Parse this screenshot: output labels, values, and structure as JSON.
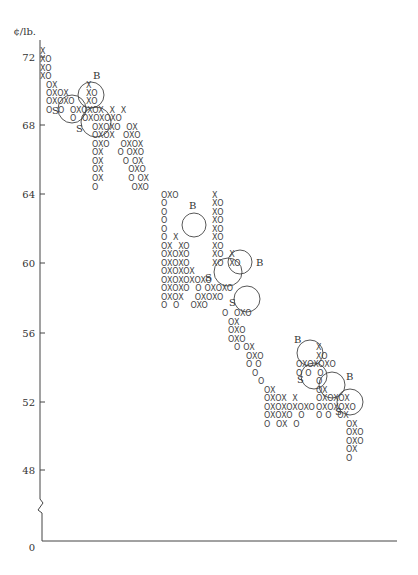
{
  "chart_data": {
    "type": "point-and-figure",
    "title": "",
    "ylabel": "¢/lb.",
    "xlabel": "",
    "y_ticks": [
      72,
      68,
      64,
      60,
      56,
      52,
      48
    ],
    "y_origin_label": "0",
    "axis_break": true,
    "box_size": 0.5,
    "ylim": [
      48,
      72.5
    ],
    "grid": false,
    "legend": null,
    "symbols": {
      "rising": "X",
      "falling": "O"
    },
    "trend": "downtrend from ~72 ¢/lb to ~50 ¢/lb",
    "signals": [
      {
        "label": "B",
        "type": "buy",
        "approx_price": 69.5
      },
      {
        "label": "S",
        "type": "sell",
        "approx_price": 68.8
      },
      {
        "label": "S",
        "type": "sell",
        "approx_price": 68.2
      },
      {
        "label": "B",
        "type": "buy",
        "approx_price": 62.0
      },
      {
        "label": "S",
        "type": "sell",
        "approx_price": 59.2
      },
      {
        "label": "B",
        "type": "buy",
        "approx_price": 60.0
      },
      {
        "label": "S",
        "type": "sell",
        "approx_price": 57.5
      },
      {
        "label": "B",
        "type": "buy",
        "approx_price": 54.5
      },
      {
        "label": "S",
        "type": "sell",
        "approx_price": 53.8
      },
      {
        "label": "B",
        "type": "buy",
        "approx_price": 53.0
      },
      {
        "label": "S",
        "type": "sell",
        "approx_price": 51.8
      }
    ],
    "rows": [
      {
        "x": 40,
        "y": 54,
        "text": "X"
      },
      {
        "x": 40,
        "y": 62,
        "text": "XO"
      },
      {
        "x": 40,
        "y": 71,
        "text": "XO"
      },
      {
        "x": 40,
        "y": 79,
        "text": "XO"
      },
      {
        "x": 46,
        "y": 88,
        "text": "OX"
      },
      {
        "x": 46,
        "y": 96,
        "text": "OXOX"
      },
      {
        "x": 46,
        "y": 104,
        "text": "OXOXO"
      },
      {
        "x": 46,
        "y": 113,
        "text": "O  O"
      },
      {
        "x": 86,
        "y": 88,
        "text": "X"
      },
      {
        "x": 86,
        "y": 96,
        "text": "XO"
      },
      {
        "x": 86,
        "y": 104,
        "text": "XO"
      },
      {
        "x": 70,
        "y": 113,
        "text": "OXOXOX  X  X"
      },
      {
        "x": 70,
        "y": 121,
        "text": "O  OXOXOXO"
      },
      {
        "x": 92,
        "y": 130,
        "text": "OXOXO  OX"
      },
      {
        "x": 92,
        "y": 138,
        "text": "OXOX   OXO"
      },
      {
        "x": 92,
        "y": 147,
        "text": "OXO    OXOX"
      },
      {
        "x": 92,
        "y": 155,
        "text": "OX     O OXO"
      },
      {
        "x": 92,
        "y": 164,
        "text": "OX       O OX"
      },
      {
        "x": 92,
        "y": 172,
        "text": "OX         OXO"
      },
      {
        "x": 92,
        "y": 181,
        "text": "OX         O OX"
      },
      {
        "x": 92,
        "y": 190,
        "text": "O            OXO"
      },
      {
        "x": 161,
        "y": 198,
        "text": "OXO"
      },
      {
        "x": 161,
        "y": 206,
        "text": "O"
      },
      {
        "x": 161,
        "y": 215,
        "text": "O"
      },
      {
        "x": 161,
        "y": 223,
        "text": "O"
      },
      {
        "x": 161,
        "y": 232,
        "text": "O"
      },
      {
        "x": 161,
        "y": 240,
        "text": "O  X"
      },
      {
        "x": 161,
        "y": 249,
        "text": "OX  XO"
      },
      {
        "x": 161,
        "y": 257,
        "text": "OXOXO"
      },
      {
        "x": 161,
        "y": 266,
        "text": "OXOXO"
      },
      {
        "x": 161,
        "y": 274,
        "text": "OXOXOX"
      },
      {
        "x": 161,
        "y": 283,
        "text": "OXOXOXOXO"
      },
      {
        "x": 212,
        "y": 198,
        "text": "X"
      },
      {
        "x": 212,
        "y": 206,
        "text": "XO"
      },
      {
        "x": 212,
        "y": 215,
        "text": "XO"
      },
      {
        "x": 212,
        "y": 223,
        "text": "XO"
      },
      {
        "x": 212,
        "y": 232,
        "text": "XO"
      },
      {
        "x": 212,
        "y": 240,
        "text": "XO"
      },
      {
        "x": 212,
        "y": 249,
        "text": "XO"
      },
      {
        "x": 212,
        "y": 257,
        "text": "XO  X"
      },
      {
        "x": 212,
        "y": 266,
        "text": "XO  XO"
      },
      {
        "x": 161,
        "y": 291,
        "text": "OXOXO  O OXOXO"
      },
      {
        "x": 161,
        "y": 300,
        "text": "OXOX    OXOXO"
      },
      {
        "x": 161,
        "y": 308,
        "text": "O  O    OXO"
      },
      {
        "x": 222,
        "y": 316,
        "text": "O  OXO"
      },
      {
        "x": 228,
        "y": 325,
        "text": "OX"
      },
      {
        "x": 228,
        "y": 333,
        "text": "OXO"
      },
      {
        "x": 228,
        "y": 342,
        "text": "OXO"
      },
      {
        "x": 234,
        "y": 350,
        "text": "O OX"
      },
      {
        "x": 246,
        "y": 359,
        "text": "OXO"
      },
      {
        "x": 246,
        "y": 367,
        "text": "O O"
      },
      {
        "x": 252,
        "y": 376,
        "text": "O"
      },
      {
        "x": 258,
        "y": 384,
        "text": "O"
      },
      {
        "x": 264,
        "y": 393,
        "text": "OX"
      },
      {
        "x": 264,
        "y": 401,
        "text": "OXOX  X"
      },
      {
        "x": 264,
        "y": 410,
        "text": "OXOXOXOXO"
      },
      {
        "x": 264,
        "y": 418,
        "text": "OXOXO  O"
      },
      {
        "x": 264,
        "y": 427,
        "text": "O  OX  O"
      }
    ],
    "rows_right": [
      {
        "x": 316,
        "y": 350,
        "text": "X"
      },
      {
        "x": 316,
        "y": 359,
        "text": "XO"
      },
      {
        "x": 296,
        "y": 367,
        "text": "OXOXOXO"
      },
      {
        "x": 296,
        "y": 376,
        "text": "O O  O"
      },
      {
        "x": 316,
        "y": 384,
        "text": "O"
      },
      {
        "x": 316,
        "y": 393,
        "text": "OX"
      },
      {
        "x": 316,
        "y": 401,
        "text": "OXOXOX"
      },
      {
        "x": 316,
        "y": 410,
        "text": "OXOXOXO"
      },
      {
        "x": 316,
        "y": 418,
        "text": "O O  OX"
      },
      {
        "x": 346,
        "y": 427,
        "text": "OX"
      },
      {
        "x": 346,
        "y": 435,
        "text": "OXO"
      },
      {
        "x": 346,
        "y": 444,
        "text": "OXO"
      },
      {
        "x": 346,
        "y": 452,
        "text": "OX"
      },
      {
        "x": 346,
        "y": 461,
        "text": "O"
      }
    ]
  },
  "axis": {
    "unit_label": "¢/lb.",
    "ticks": [
      {
        "label": "72",
        "y": 57
      },
      {
        "label": "68",
        "y": 125
      },
      {
        "label": "64",
        "y": 194
      },
      {
        "label": "60",
        "y": 263
      },
      {
        "label": "56",
        "y": 333
      },
      {
        "label": "52",
        "y": 402
      },
      {
        "label": "48",
        "y": 470
      }
    ],
    "origin_label": "0"
  },
  "circles": [
    {
      "cx": 91,
      "cy": 95,
      "r": 13,
      "label": "B",
      "lx": 93,
      "ly": 79,
      "side": "top"
    },
    {
      "cx": 72,
      "cy": 109,
      "r": 14,
      "label": "S",
      "lx": 52,
      "ly": 114,
      "side": "left"
    },
    {
      "cx": 96,
      "cy": 122,
      "r": 15,
      "label": "S",
      "lx": 76,
      "ly": 132,
      "side": "left"
    },
    {
      "cx": 194,
      "cy": 225,
      "r": 12,
      "label": "B",
      "lx": 189,
      "ly": 209,
      "side": "top"
    },
    {
      "cx": 228,
      "cy": 272,
      "r": 14,
      "label": "S",
      "lx": 205,
      "ly": 281,
      "side": "left"
    },
    {
      "cx": 240,
      "cy": 262,
      "r": 12,
      "label": "B",
      "lx": 256,
      "ly": 266,
      "side": "right"
    },
    {
      "cx": 247,
      "cy": 299,
      "r": 13,
      "label": "S",
      "lx": 229,
      "ly": 306,
      "side": "left"
    },
    {
      "cx": 310,
      "cy": 353,
      "r": 13,
      "label": "B",
      "lx": 294,
      "ly": 343,
      "side": "top"
    },
    {
      "cx": 314,
      "cy": 376,
      "r": 13,
      "label": "S",
      "lx": 297,
      "ly": 383,
      "side": "left"
    },
    {
      "cx": 332,
      "cy": 385,
      "r": 13,
      "label": "B",
      "lx": 346,
      "ly": 380,
      "side": "right"
    },
    {
      "cx": 350,
      "cy": 402,
      "r": 13,
      "label": "S",
      "lx": 335,
      "ly": 415,
      "side": "left"
    }
  ]
}
